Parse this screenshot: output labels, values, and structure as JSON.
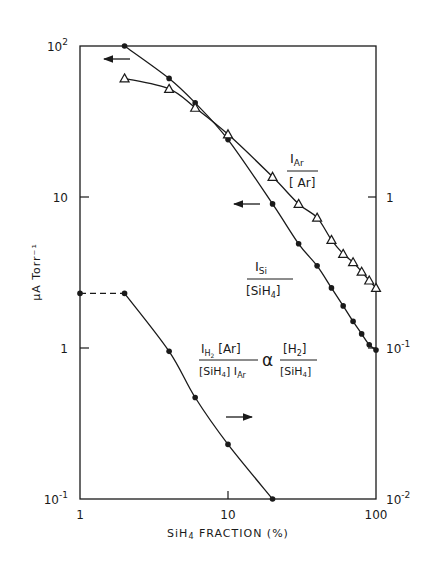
{
  "chart_data": {
    "type": "scatter",
    "title": "",
    "xlabel": "SiH4 FRACTION (%)",
    "ylabel": "μA Torr⁻¹",
    "ylabel_right": "",
    "xscale": "log",
    "yscale": "log",
    "xlim": [
      1,
      100
    ],
    "ylim": [
      0.1,
      100
    ],
    "ylim_right": [
      0.01,
      10
    ],
    "grid": false,
    "x_ticks": [
      {
        "value": 1,
        "label": "1"
      },
      {
        "value": 10,
        "label": "10"
      },
      {
        "value": 100,
        "label": "100"
      }
    ],
    "y_ticks_left": [
      {
        "value": 100,
        "label": "10",
        "sup": "2"
      },
      {
        "value": 10,
        "label": "10",
        "sup": ""
      },
      {
        "value": 1,
        "label": "1",
        "sup": ""
      },
      {
        "value": 0.1,
        "label": "10",
        "sup": "-1"
      }
    ],
    "y_ticks_right": [
      {
        "value": 1,
        "label": "1",
        "sup": ""
      },
      {
        "value": 0.1,
        "label": "10",
        "sup": "-1"
      },
      {
        "value": 0.01,
        "label": "10",
        "sup": "-2"
      }
    ],
    "series": [
      {
        "name": "I_Si / [SiH4]",
        "axis": "left",
        "marker": "filled-circle",
        "x": [
          2,
          4,
          6,
          10,
          20,
          30,
          40,
          50,
          60,
          70,
          80,
          90,
          100
        ],
        "y": [
          100,
          61,
          42,
          24,
          9.0,
          4.9,
          3.5,
          2.5,
          1.9,
          1.5,
          1.24,
          1.05,
          0.97
        ]
      },
      {
        "name": "I_Ar / [Ar]",
        "axis": "left",
        "marker": "open-triangle",
        "x": [
          2,
          4,
          6,
          10,
          20,
          30,
          40,
          50,
          60,
          70,
          80,
          90,
          100
        ],
        "y": [
          61,
          52,
          39,
          26,
          13.6,
          9.0,
          7.3,
          5.2,
          4.2,
          3.7,
          3.2,
          2.8,
          2.5
        ]
      },
      {
        "name": "I_H2[Ar] / ([SiH4] I_Ar) ∝ [H2]/[SiH4]",
        "axis": "right",
        "marker": "filled-circle",
        "x": [
          1,
          2,
          4,
          6,
          10,
          20
        ],
        "y": [
          0.23,
          0.23,
          0.095,
          0.047,
          0.023,
          0.01
        ],
        "note": "segment from x=1 to x=2 drawn dashed"
      }
    ],
    "annotations": [
      {
        "text": "←",
        "meaning": "I_Si series uses left axis",
        "at": [
          1.7,
          70
        ]
      },
      {
        "text": "←",
        "meaning": "left axis",
        "at": [
          11,
          9.0
        ]
      },
      {
        "text": "→",
        "meaning": "bottom series uses right axis",
        "at": [
          9.5,
          0.09
        ]
      }
    ],
    "labels": {
      "iar_num": "I",
      "iar_num_sub": "Ar",
      "iar_den": "[ Ar]",
      "isi_num": "I",
      "isi_num_sub": "Si",
      "isi_den": "[SiH",
      "isi_den_sub": "4",
      "isi_den_end": "]",
      "h2_num": "I",
      "h2_num_sub": "H2",
      "h2_num_end": " [Ar]",
      "h2_den": "[SiH4] I",
      "h2_den_sub": "Ar",
      "propto": "α",
      "h2r_num": "[H2]",
      "h2r_den": "[SiH4]"
    },
    "xlabel_parts": {
      "a": "SiH",
      "sub": "4",
      "b": " FRACTION (%)"
    }
  }
}
